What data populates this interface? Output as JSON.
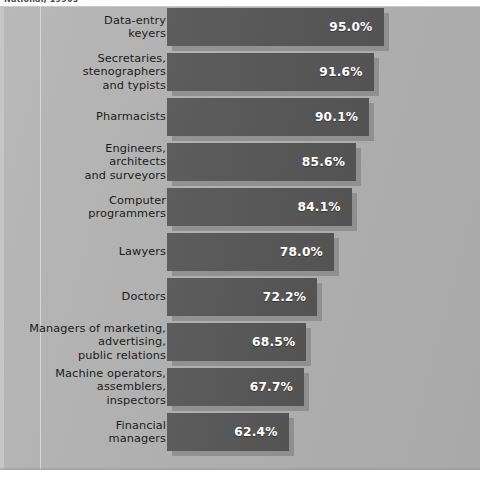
{
  "top_fragment_text": "National, 1990s",
  "chart_data": {
    "type": "bar",
    "orientation": "horizontal",
    "title": "",
    "subtitle": "",
    "xlabel": "",
    "ylabel": "",
    "legend": [],
    "grid": false,
    "value_suffix": "%",
    "xlim": [
      0,
      100
    ],
    "categories": [
      "Data-entry\nkeyers",
      "Secretaries,\nstenographers\nand typists",
      "Pharmacists",
      "Engineers,\narchitects\nand surveyors",
      "Computer\nprogrammers",
      "Lawyers",
      "Doctors",
      "Managers of marketing,\nadvertising,\npublic relations",
      "Machine operators,\nassemblers,\ninspectors",
      "Financial\nmanagers"
    ],
    "values": [
      95.0,
      91.6,
      90.1,
      85.6,
      84.1,
      78.0,
      72.2,
      68.5,
      67.7,
      62.4
    ],
    "value_labels": [
      "95.0%",
      "91.6%",
      "90.1%",
      "85.6%",
      "84.1%",
      "78.0%",
      "72.2%",
      "68.5%",
      "67.7%",
      "62.4%"
    ],
    "colors": {
      "bar": "#575757",
      "bar_shadow": "#787878",
      "panel_background": "#b2b2b2",
      "value_text": "#ffffff",
      "label_text": "#1b1b1b",
      "page_background": "#ffffff"
    }
  }
}
